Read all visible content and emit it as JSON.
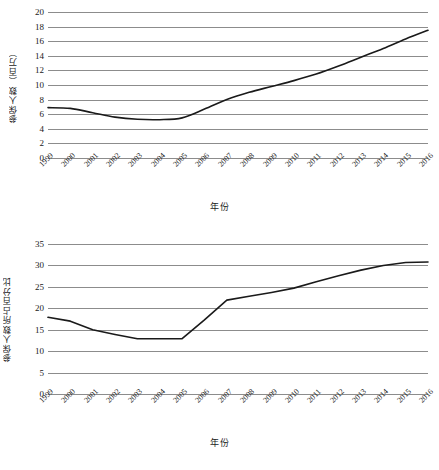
{
  "chart_data": [
    {
      "type": "line",
      "id": "insured-count",
      "title": "",
      "xlabel": "年份",
      "ylabel": "参保人数（百万）",
      "categories": [
        "1999",
        "2000",
        "2001",
        "2002",
        "2003",
        "2004",
        "2005",
        "2006",
        "2007",
        "2008",
        "2009",
        "2010",
        "2011",
        "2012",
        "2013",
        "2014",
        "2015",
        "2016"
      ],
      "values": [
        6.9,
        6.8,
        6.2,
        5.6,
        5.3,
        5.25,
        5.5,
        6.7,
        8.0,
        9.0,
        9.8,
        10.6,
        11.5,
        12.6,
        13.8,
        15.0,
        16.3,
        17.5
      ],
      "ylim": [
        0,
        20
      ],
      "yticks": [
        0,
        2,
        4,
        6,
        8,
        10,
        12,
        14,
        16,
        18,
        20
      ],
      "grid": true,
      "legend": "none",
      "smooth": true
    },
    {
      "type": "line",
      "id": "insured-percentage",
      "title": "",
      "xlabel": "年份",
      "ylabel": "参保人数所占百分比",
      "categories": [
        "1999",
        "2000",
        "2001",
        "2002",
        "2003",
        "2004",
        "2005",
        "2006",
        "2007",
        "2008",
        "2009",
        "2010",
        "2011",
        "2012",
        "2013",
        "2014",
        "2015",
        "2016"
      ],
      "values": [
        17.9,
        17.0,
        15.0,
        13.9,
        12.9,
        12.9,
        12.9,
        17.3,
        21.9,
        22.8,
        23.7,
        24.7,
        26.2,
        27.6,
        28.9,
        30.0,
        30.7,
        30.8
      ],
      "ylim": [
        0,
        35
      ],
      "yticks": [
        0,
        5,
        10,
        15,
        20,
        25,
        30,
        35
      ],
      "grid": true,
      "legend": "none",
      "smooth": false
    }
  ]
}
